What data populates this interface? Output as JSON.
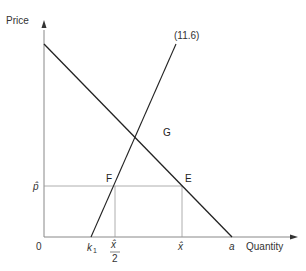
{
  "diagram": {
    "axes": {
      "y_label": "Price",
      "x_label": "Quantity",
      "origin_label": "0"
    },
    "curves": {
      "supply_label": "(11.6)"
    },
    "points": {
      "G": "G",
      "F": "F",
      "E": "E"
    },
    "y_ticks": {
      "p_hat": "p̂"
    },
    "x_ticks": {
      "k1_main": "k",
      "k1_sub": "1",
      "x_hat_half_num": "x̂",
      "x_hat_half_den": "2",
      "x_hat": "x̂",
      "a": "a"
    },
    "colors": {
      "line": "#222222",
      "guide": "#999999",
      "text": "#333333"
    }
  }
}
